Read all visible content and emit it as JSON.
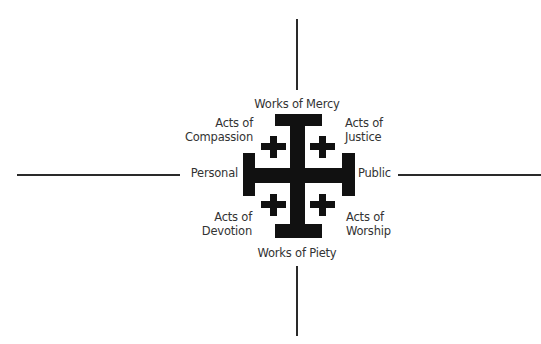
{
  "diagram": {
    "type": "jerusalem-cross-quadrant",
    "axes": {
      "top": "Works of Mercy",
      "bottom": "Works of Piety",
      "left": "Personal",
      "right": "Public"
    },
    "quadrants": {
      "top_left": {
        "line1": "Acts of",
        "line2": "Compassion"
      },
      "top_right": {
        "line1": "Acts of",
        "line2": "Justice"
      },
      "bottom_left": {
        "line1": "Acts of",
        "line2": "Devotion"
      },
      "bottom_right": {
        "line1": "Acts of",
        "line2": "Worship"
      }
    },
    "colors": {
      "symbol": "#111111",
      "text": "#333333",
      "lines": "#2a2a2a",
      "background": "#ffffff"
    }
  }
}
